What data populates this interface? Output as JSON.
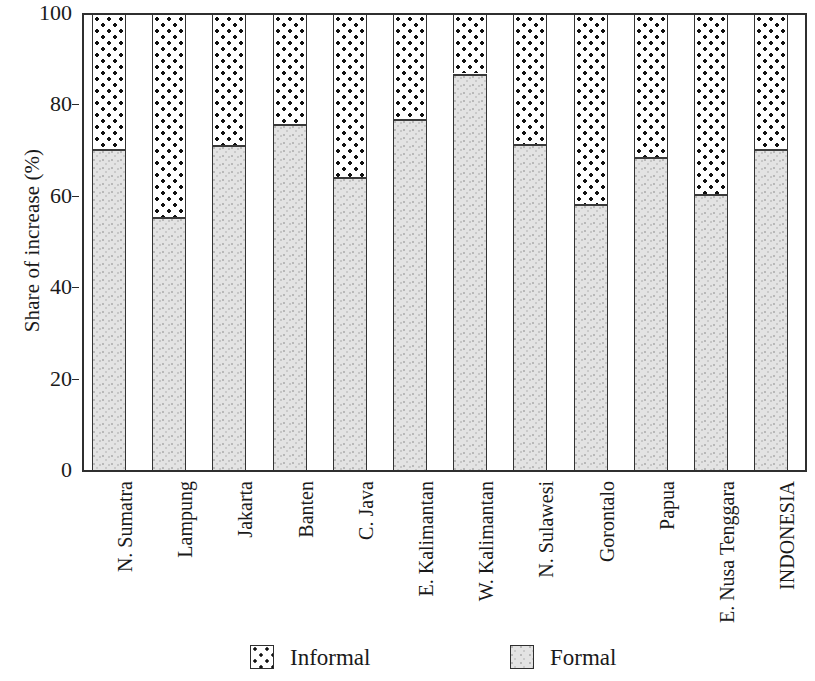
{
  "chart_data": {
    "type": "bar",
    "subtype": "stacked-100",
    "title": "",
    "xlabel": "",
    "ylabel": "Share of increase (%)",
    "ylim": [
      0,
      100
    ],
    "yticks": [
      0,
      20,
      40,
      60,
      80,
      100
    ],
    "grid": false,
    "legend_position": "bottom",
    "categories": [
      "N. Sumatra",
      "Lampung",
      "Jakarta",
      "Banten",
      "C. Java",
      "E. Kalimantan",
      "W. Kalimantan",
      "N. Sulawesi",
      "Gorontalo",
      "Papua",
      "E. Nusa Tenggara",
      "INDONESIA"
    ],
    "series": [
      {
        "name": "Formal",
        "color": "#e3e3e3",
        "pattern": "light-gray-stipple",
        "values": [
          70.7,
          55.8,
          71.6,
          76.2,
          64.6,
          77.3,
          87.2,
          71.8,
          58.6,
          68.9,
          60.8,
          70.7
        ]
      },
      {
        "name": "Informal",
        "color": "#ffffff",
        "pattern": "black-dots",
        "values": [
          29.3,
          44.2,
          28.4,
          23.8,
          35.4,
          22.7,
          12.8,
          28.2,
          41.4,
          31.1,
          39.2,
          29.3
        ]
      }
    ]
  },
  "axis": {
    "y_title": "Share of increase (%)",
    "y_tick_labels": [
      "100",
      "80",
      "60",
      "40",
      "20",
      "0"
    ]
  },
  "legend": {
    "items": [
      {
        "label": "Informal",
        "swatch": "dotted-swatch"
      },
      {
        "label": "Formal",
        "swatch": "gray-swatch"
      }
    ]
  }
}
